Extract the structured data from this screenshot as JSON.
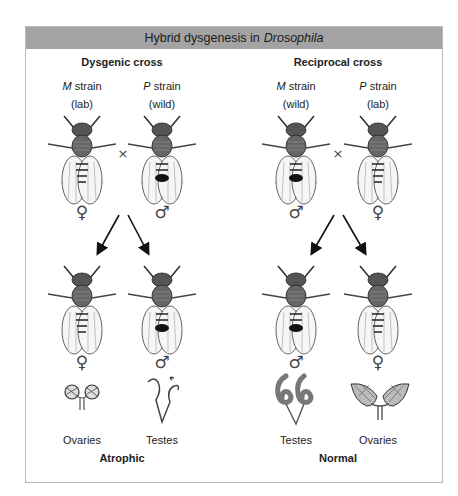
{
  "title": {
    "prefix": "Hybrid dysgenesis in",
    "italic": "Drosophila"
  },
  "panels": [
    {
      "heading": "Dysgenic cross",
      "parents": [
        {
          "strain_letter": "M",
          "strain_word": "strain",
          "origin": "(lab)",
          "sex": "♀"
        },
        {
          "strain_letter": "P",
          "strain_word": "strain",
          "origin": "(wild)",
          "sex": "♂"
        }
      ],
      "cross_symbol": "×",
      "offspring": [
        {
          "sex": "♀",
          "organ": "Ovaries"
        },
        {
          "sex": "♂",
          "organ": "Testes"
        }
      ],
      "outcome": "Atrophic"
    },
    {
      "heading": "Reciprocal cross",
      "parents": [
        {
          "strain_letter": "M",
          "strain_word": "strain",
          "origin": "(wild)",
          "sex": "♂"
        },
        {
          "strain_letter": "P",
          "strain_word": "strain",
          "origin": "(lab)",
          "sex": "♀"
        }
      ],
      "cross_symbol": "×",
      "offspring": [
        {
          "sex": "♂",
          "organ": "Testes"
        },
        {
          "sex": "♀",
          "organ": "Ovaries"
        }
      ],
      "outcome": "Normal"
    }
  ],
  "colors": {
    "header_bg": "#a3a3a3",
    "border": "#b8b8b8"
  }
}
